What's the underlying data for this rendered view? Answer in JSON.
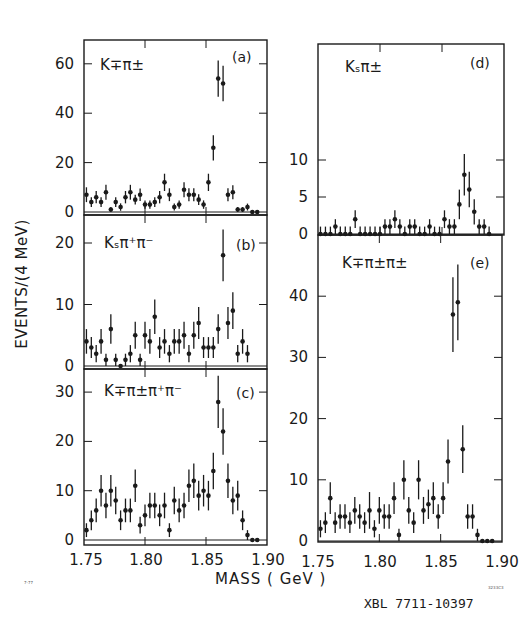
{
  "figure": {
    "y_axis_label": "EVENTS/(4 MeV)",
    "x_axis_title": "MASS    ( GeV )",
    "x_tick_labels": [
      "1.75",
      "1.80",
      "1.85",
      "1.90"
    ],
    "footer_code": "XBL 7711-10397",
    "small_left_code": "7-77",
    "small_right_code": "3233C3",
    "ink_color": "#1a1a1a",
    "background": "#ffffff"
  },
  "chart_data": [
    {
      "type": "scatter",
      "panel": "a",
      "panel_label": "(a)",
      "title": "K∓π±",
      "xlabel": "MASS (GeV)",
      "ylabel": "EVENTS/(4 MeV)",
      "xlim": [
        1.75,
        1.9
      ],
      "ylim": [
        0,
        70
      ],
      "yticks": [
        0,
        20,
        40,
        60
      ],
      "ytick_labels": [
        "0",
        "20",
        "40",
        "60"
      ],
      "x": [
        1.752,
        1.756,
        1.76,
        1.764,
        1.768,
        1.772,
        1.776,
        1.78,
        1.784,
        1.788,
        1.792,
        1.796,
        1.8,
        1.804,
        1.808,
        1.812,
        1.816,
        1.82,
        1.824,
        1.828,
        1.832,
        1.836,
        1.84,
        1.844,
        1.848,
        1.852,
        1.856,
        1.86,
        1.864,
        1.868,
        1.872,
        1.876,
        1.88,
        1.884,
        1.888,
        1.892
      ],
      "values": [
        7,
        4,
        6,
        4,
        8,
        1,
        4,
        2,
        6,
        8,
        5,
        7,
        3,
        3,
        4,
        6,
        12,
        7,
        2,
        3,
        9,
        7,
        7,
        5,
        3,
        12,
        26,
        54,
        52,
        7,
        8,
        1,
        1,
        2,
        0,
        0
      ],
      "errors": [
        3,
        2,
        2.5,
        2,
        3,
        1,
        2,
        1.5,
        2.5,
        3,
        2,
        2.5,
        1.7,
        1.7,
        2,
        2.5,
        3.5,
        2.6,
        1.4,
        1.7,
        3,
        2.6,
        2.6,
        2.2,
        1.7,
        3.5,
        5.1,
        7.3,
        7.2,
        2.6,
        2.8,
        1,
        1,
        1.4,
        0,
        0
      ]
    },
    {
      "type": "scatter",
      "panel": "b",
      "panel_label": "(b)",
      "title": "Kₛπ⁺π⁻",
      "xlim": [
        1.75,
        1.9
      ],
      "ylim": [
        0,
        25
      ],
      "yticks": [
        0,
        10,
        20
      ],
      "ytick_labels": [
        "0",
        "10",
        "20"
      ],
      "x": [
        1.752,
        1.756,
        1.76,
        1.764,
        1.768,
        1.772,
        1.776,
        1.78,
        1.784,
        1.788,
        1.792,
        1.796,
        1.8,
        1.804,
        1.808,
        1.812,
        1.816,
        1.82,
        1.824,
        1.828,
        1.832,
        1.836,
        1.84,
        1.844,
        1.848,
        1.852,
        1.856,
        1.86,
        1.864,
        1.868,
        1.872,
        1.876,
        1.88,
        1.884
      ],
      "values": [
        4,
        3,
        2,
        4,
        1,
        6,
        1,
        0,
        1,
        2,
        5,
        1,
        5,
        4,
        8,
        3,
        4,
        2,
        4,
        4,
        5,
        2,
        5,
        7,
        3,
        3,
        3,
        6,
        18,
        7,
        9,
        2,
        4,
        2
      ],
      "errors": [
        2,
        1.7,
        1.4,
        2,
        1,
        2.4,
        1,
        0,
        1,
        1.4,
        2.2,
        1,
        2.2,
        2,
        2.8,
        1.7,
        2,
        1.4,
        2,
        2,
        2.2,
        1.4,
        2.2,
        2.6,
        1.7,
        1.7,
        1.7,
        2.4,
        4.2,
        2.6,
        3,
        1.4,
        2,
        1.4
      ]
    },
    {
      "type": "scatter",
      "panel": "c",
      "panel_label": "(c)",
      "title": "K∓π±π⁺π⁻",
      "xlim": [
        1.75,
        1.9
      ],
      "ylim": [
        0,
        35
      ],
      "yticks": [
        0,
        10,
        20,
        30
      ],
      "ytick_labels": [
        "0",
        "10",
        "20",
        "30"
      ],
      "x": [
        1.752,
        1.756,
        1.76,
        1.764,
        1.768,
        1.772,
        1.776,
        1.78,
        1.784,
        1.788,
        1.792,
        1.796,
        1.8,
        1.804,
        1.808,
        1.812,
        1.816,
        1.82,
        1.824,
        1.828,
        1.832,
        1.836,
        1.84,
        1.844,
        1.848,
        1.852,
        1.856,
        1.86,
        1.864,
        1.868,
        1.872,
        1.876,
        1.88,
        1.884,
        1.888,
        1.892
      ],
      "values": [
        2,
        4,
        6,
        10,
        7,
        10,
        8,
        4,
        6,
        6,
        11,
        3,
        5,
        7,
        7,
        5,
        7,
        2,
        8,
        6,
        7,
        11,
        12,
        9,
        10,
        9,
        14,
        28,
        22,
        12,
        8,
        9,
        4,
        1,
        0,
        0
      ],
      "errors": [
        1.4,
        2,
        2.4,
        3.2,
        2.6,
        3.2,
        2.8,
        2,
        2.4,
        2.4,
        3.3,
        1.7,
        2.2,
        2.6,
        2.6,
        2.2,
        2.6,
        1.4,
        2.8,
        2.4,
        2.6,
        3.3,
        3.5,
        3,
        3.2,
        3,
        3.7,
        5.3,
        4.7,
        3.5,
        2.8,
        3,
        2,
        1,
        0,
        0
      ]
    },
    {
      "type": "scatter",
      "panel": "d",
      "panel_label": "(d)",
      "title": "Kₛπ±",
      "xlim": [
        1.75,
        1.9
      ],
      "ylim": [
        0,
        13
      ],
      "yticks": [
        0,
        5,
        10
      ],
      "ytick_labels": [
        "0",
        "5",
        "10"
      ],
      "x": [
        1.752,
        1.756,
        1.76,
        1.764,
        1.768,
        1.772,
        1.776,
        1.78,
        1.784,
        1.788,
        1.792,
        1.796,
        1.8,
        1.804,
        1.808,
        1.812,
        1.816,
        1.82,
        1.824,
        1.828,
        1.832,
        1.836,
        1.84,
        1.844,
        1.848,
        1.852,
        1.856,
        1.86,
        1.864,
        1.868,
        1.872,
        1.876,
        1.88,
        1.884,
        1.888
      ],
      "values": [
        0,
        0,
        0,
        1,
        0,
        0,
        0,
        2,
        0,
        0,
        0,
        0,
        0,
        1,
        1,
        2,
        1,
        0,
        1,
        1,
        0,
        0,
        1,
        0,
        0,
        2,
        1,
        1,
        4,
        8,
        6,
        3,
        1,
        1,
        0
      ],
      "errors": [
        1,
        1,
        1,
        1,
        1,
        1,
        1,
        1.2,
        1,
        1,
        1,
        1,
        1,
        1,
        1,
        1.2,
        1,
        1,
        1,
        1,
        1,
        1,
        1,
        1,
        1,
        1.2,
        1,
        1,
        2,
        2.8,
        2.4,
        1.7,
        1,
        1,
        1
      ]
    },
    {
      "type": "scatter",
      "panel": "e",
      "panel_label": "(e)",
      "title": "K∓π±π±",
      "xlim": [
        1.75,
        1.9
      ],
      "ylim": [
        0,
        50
      ],
      "yticks": [
        0,
        10,
        20,
        30,
        40
      ],
      "ytick_labels": [
        "0",
        "10",
        "20",
        "30",
        "40"
      ],
      "x": [
        1.752,
        1.756,
        1.76,
        1.764,
        1.768,
        1.772,
        1.776,
        1.78,
        1.784,
        1.788,
        1.792,
        1.796,
        1.8,
        1.804,
        1.808,
        1.812,
        1.816,
        1.82,
        1.824,
        1.828,
        1.832,
        1.836,
        1.84,
        1.844,
        1.848,
        1.852,
        1.856,
        1.86,
        1.864,
        1.868,
        1.872,
        1.876,
        1.88,
        1.884,
        1.888,
        1.892
      ],
      "values": [
        2,
        3,
        7,
        3,
        4,
        4,
        3,
        5,
        4,
        3,
        5,
        2,
        5,
        4,
        4,
        7,
        1,
        10,
        5,
        3,
        10,
        5,
        6,
        7,
        4,
        7,
        13,
        37,
        39,
        15,
        4,
        4,
        1,
        0,
        0,
        0
      ],
      "errors": [
        1.4,
        1.7,
        2.6,
        1.7,
        2,
        2,
        1.7,
        2.2,
        2,
        1.7,
        3,
        1.4,
        2.2,
        2,
        2,
        2.6,
        1,
        3.2,
        2.2,
        1.7,
        3.2,
        2.2,
        2.4,
        2.6,
        2,
        2.6,
        3.6,
        6.1,
        6.2,
        3.9,
        2,
        2,
        1,
        0,
        0,
        0
      ]
    }
  ]
}
